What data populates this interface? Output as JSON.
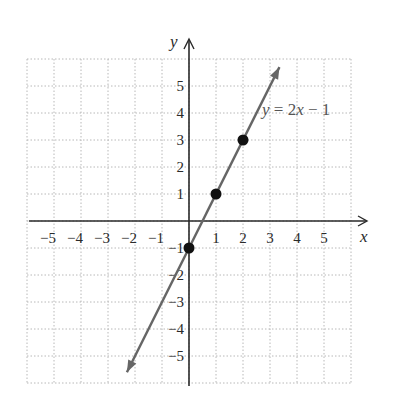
{
  "chart_data": {
    "type": "line",
    "title": "",
    "xlabel": "x",
    "ylabel": "y",
    "xlim": [
      -6,
      6
    ],
    "ylim": [
      -6,
      6
    ],
    "grid": true,
    "x_ticks": [
      -5,
      -4,
      -3,
      -2,
      -1,
      1,
      2,
      3,
      4,
      5
    ],
    "y_ticks": [
      5,
      4,
      3,
      2,
      1,
      -1,
      -2,
      -3,
      -4,
      -5
    ],
    "x_tick_labels": [
      "−5",
      "−4",
      "−3",
      "−2",
      "−1",
      "1",
      "2",
      "3",
      "4",
      "5"
    ],
    "y_tick_labels": [
      "5",
      "4",
      "3",
      "2",
      "1",
      "−1",
      "−2",
      "−3",
      "−4",
      "−5"
    ],
    "series": [
      {
        "name": "y = 2x − 1",
        "equation": "y = 2x − 1",
        "slope": 2,
        "intercept": -1,
        "x_range": [
          -2.3,
          3.35
        ],
        "color": "#666666",
        "points": [
          {
            "x": 0,
            "y": -1
          },
          {
            "x": 1,
            "y": 1
          },
          {
            "x": 2,
            "y": 3
          }
        ]
      }
    ],
    "annotations": [
      {
        "text": "y = 2x − 1",
        "x": 2.7,
        "y": 4
      }
    ]
  },
  "labels": {
    "x_axis": "x",
    "y_axis": "y",
    "equation_prefix": "y",
    "equation_rest": " = 2",
    "equation_x": "x",
    "equation_tail": " − 1"
  }
}
